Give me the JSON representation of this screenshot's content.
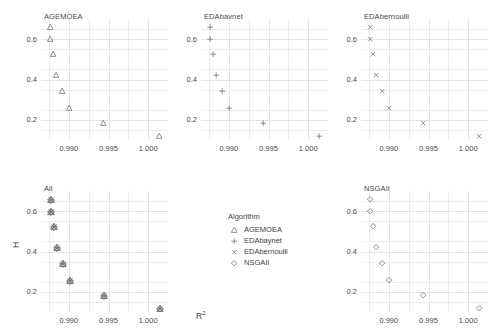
{
  "chart_data": {
    "type": "scatter",
    "title": "",
    "xlabel": "R²",
    "ylabel": "H",
    "xlim": [
      0.9865,
      1.0025
    ],
    "ylim": [
      0.1,
      0.7
    ],
    "grid": true,
    "xticks": [
      0.99,
      0.995,
      1.0
    ],
    "xtick_labels": [
      "0.990",
      "0.995",
      "1.000"
    ],
    "yticks": [
      0.2,
      0.4,
      0.6
    ],
    "ytick_labels": [
      "0.2",
      "0.4",
      "0.6"
    ],
    "facet_layout": "2 rows x 3 columns",
    "legend_position": "center-bottom-middle-panel",
    "marker_color": "#6e6e6e",
    "gridline_color": "#ededed",
    "panel_background": "#ffffff",
    "facets": [
      {
        "name": "AGEMOEA",
        "marker": "triangle",
        "points": [
          {
            "x": 0.9876,
            "y": 0.66
          },
          {
            "x": 0.9876,
            "y": 0.6
          },
          {
            "x": 0.988,
            "y": 0.525
          },
          {
            "x": 0.9884,
            "y": 0.425
          },
          {
            "x": 0.9891,
            "y": 0.345
          },
          {
            "x": 0.99,
            "y": 0.258
          },
          {
            "x": 0.9943,
            "y": 0.185
          },
          {
            "x": 1.0013,
            "y": 0.118
          }
        ]
      },
      {
        "name": "EDAbaynet",
        "marker": "plus",
        "points": [
          {
            "x": 0.9876,
            "y": 0.66
          },
          {
            "x": 0.9876,
            "y": 0.6
          },
          {
            "x": 0.988,
            "y": 0.525
          },
          {
            "x": 0.9884,
            "y": 0.425
          },
          {
            "x": 0.9891,
            "y": 0.345
          },
          {
            "x": 0.99,
            "y": 0.258
          },
          {
            "x": 0.9943,
            "y": 0.185
          },
          {
            "x": 1.0013,
            "y": 0.118
          }
        ]
      },
      {
        "name": "EDAbernoulli",
        "marker": "cross",
        "points": [
          {
            "x": 0.9876,
            "y": 0.66
          },
          {
            "x": 0.9876,
            "y": 0.6
          },
          {
            "x": 0.988,
            "y": 0.525
          },
          {
            "x": 0.9884,
            "y": 0.425
          },
          {
            "x": 0.9891,
            "y": 0.345
          },
          {
            "x": 0.99,
            "y": 0.258
          },
          {
            "x": 0.9943,
            "y": 0.185
          },
          {
            "x": 1.0013,
            "y": 0.118
          }
        ]
      },
      {
        "name": "All",
        "marker": "all-overlaid",
        "points": [
          {
            "x": 0.9876,
            "y": 0.66
          },
          {
            "x": 0.9876,
            "y": 0.6
          },
          {
            "x": 0.988,
            "y": 0.525
          },
          {
            "x": 0.9884,
            "y": 0.425
          },
          {
            "x": 0.9891,
            "y": 0.345
          },
          {
            "x": 0.99,
            "y": 0.258
          },
          {
            "x": 0.9943,
            "y": 0.185
          },
          {
            "x": 1.0013,
            "y": 0.118
          }
        ]
      },
      {
        "name": "NSGAII",
        "marker": "diamond",
        "points": [
          {
            "x": 0.9876,
            "y": 0.66
          },
          {
            "x": 0.9876,
            "y": 0.6
          },
          {
            "x": 0.988,
            "y": 0.525
          },
          {
            "x": 0.9884,
            "y": 0.425
          },
          {
            "x": 0.9891,
            "y": 0.345
          },
          {
            "x": 0.99,
            "y": 0.258
          },
          {
            "x": 0.9943,
            "y": 0.185
          },
          {
            "x": 1.0013,
            "y": 0.118
          }
        ]
      }
    ]
  },
  "legend": {
    "title": "Algorithm",
    "items": [
      {
        "label": "AGEMOEA",
        "marker": "triangle"
      },
      {
        "label": "EDAbaynet",
        "marker": "plus"
      },
      {
        "label": "EDAbernoulli",
        "marker": "cross"
      },
      {
        "label": "NSGAII",
        "marker": "diamond"
      }
    ]
  },
  "facet_titles": {
    "agemoea": "AGEMOEA",
    "edabaynet": "EDAbaynet",
    "edabernoulli": "EDAbernoulli",
    "all": "All",
    "nsgaii": "NSGAII"
  },
  "axes": {
    "x_label_base": "R",
    "x_label_sup": "2",
    "y_label": "H"
  }
}
